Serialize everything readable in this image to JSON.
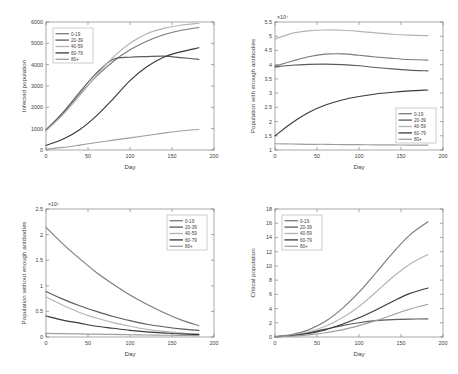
{
  "figure": {
    "background": "#ffffff",
    "series_colors": [
      "#7b7b7b",
      "#5c5c5c",
      "#b4b4b4",
      "#3a3a3a",
      "#9e9e9e"
    ],
    "axis_color": "#6e6e6e",
    "text_color": "#3d3d3d"
  },
  "legend_labels": [
    "0-19",
    "20-39",
    "40-59",
    "60-79",
    "80+"
  ],
  "chart_data": [
    {
      "id": "infected-population",
      "type": "line",
      "title": "",
      "xlabel": "Day",
      "ylabel": "Infected population",
      "xlim": [
        0,
        200
      ],
      "ylim": [
        0,
        6000
      ],
      "xticks": [
        0,
        50,
        100,
        150,
        200
      ],
      "yticks": [
        0,
        1000,
        2000,
        3000,
        4000,
        5000,
        6000
      ],
      "y_exponent": "",
      "grid": false,
      "legend_position": "top-left",
      "x": [
        0,
        20,
        40,
        60,
        80,
        100,
        120,
        140,
        160,
        182
      ],
      "series": [
        {
          "name": "0-19",
          "values": [
            950,
            1700,
            2600,
            3450,
            4150,
            4700,
            5100,
            5400,
            5600,
            5740
          ]
        },
        {
          "name": "20-39",
          "values": [
            930,
            1750,
            2700,
            3600,
            4250,
            4350,
            4380,
            4400,
            4330,
            4250
          ]
        },
        {
          "name": "40-59",
          "values": [
            900,
            1650,
            2550,
            3500,
            4350,
            5000,
            5450,
            5700,
            5850,
            5940
          ]
        },
        {
          "name": "60-79",
          "values": [
            220,
            500,
            950,
            1600,
            2400,
            3250,
            3900,
            4350,
            4600,
            4790
          ]
        },
        {
          "name": "80+",
          "values": [
            40,
            120,
            230,
            350,
            460,
            570,
            680,
            790,
            890,
            960
          ]
        }
      ]
    },
    {
      "id": "population-with-enough-antibodies",
      "type": "line",
      "title": "",
      "xlabel": "Day",
      "ylabel": "Population with enough antibodies",
      "xlim": [
        0,
        200
      ],
      "ylim": [
        1,
        5.5
      ],
      "xticks": [
        0,
        50,
        100,
        150,
        200
      ],
      "yticks": [
        1,
        1.5,
        2,
        2.5,
        3,
        3.5,
        4,
        4.5,
        5,
        5.5
      ],
      "y_exponent": "×10⁴",
      "grid": false,
      "legend_position": "bottom-right",
      "x": [
        0,
        20,
        40,
        60,
        80,
        100,
        120,
        140,
        160,
        182
      ],
      "series": [
        {
          "name": "0-19",
          "values": [
            3.95,
            4.12,
            4.28,
            4.37,
            4.38,
            4.33,
            4.27,
            4.22,
            4.18,
            4.16
          ]
        },
        {
          "name": "20-39",
          "values": [
            3.92,
            3.98,
            4.01,
            4.02,
            4.0,
            3.96,
            3.9,
            3.85,
            3.81,
            3.78
          ]
        },
        {
          "name": "40-59",
          "values": [
            4.9,
            5.1,
            5.19,
            5.22,
            5.21,
            5.17,
            5.12,
            5.07,
            5.04,
            5.02
          ]
        },
        {
          "name": "60-79",
          "values": [
            1.5,
            1.95,
            2.32,
            2.58,
            2.76,
            2.88,
            2.97,
            3.03,
            3.08,
            3.11
          ]
        },
        {
          "name": "80+",
          "values": [
            1.22,
            1.21,
            1.2,
            1.2,
            1.19,
            1.19,
            1.18,
            1.18,
            1.17,
            1.17
          ]
        }
      ]
    },
    {
      "id": "population-without-enough-antibodies",
      "type": "line",
      "title": "",
      "xlabel": "Day",
      "ylabel": "Population without enough antibodies",
      "xlim": [
        0,
        200
      ],
      "ylim": [
        0,
        2.5
      ],
      "xticks": [
        0,
        50,
        100,
        150,
        200
      ],
      "yticks": [
        0,
        0.5,
        1,
        1.5,
        2,
        2.5
      ],
      "y_exponent": "×10⁴",
      "grid": false,
      "legend_position": "top-right",
      "x": [
        0,
        20,
        40,
        60,
        80,
        100,
        120,
        140,
        160,
        182
      ],
      "series": [
        {
          "name": "0-19",
          "values": [
            2.14,
            1.82,
            1.53,
            1.26,
            1.03,
            0.82,
            0.64,
            0.48,
            0.34,
            0.22
          ]
        },
        {
          "name": "20-39",
          "values": [
            0.89,
            0.74,
            0.61,
            0.5,
            0.4,
            0.32,
            0.25,
            0.2,
            0.16,
            0.13
          ]
        },
        {
          "name": "40-59",
          "values": [
            0.78,
            0.62,
            0.48,
            0.37,
            0.28,
            0.21,
            0.15,
            0.11,
            0.08,
            0.05
          ]
        },
        {
          "name": "60-79",
          "values": [
            0.41,
            0.33,
            0.27,
            0.21,
            0.17,
            0.13,
            0.1,
            0.08,
            0.06,
            0.05
          ]
        },
        {
          "name": "80+",
          "values": [
            0.07,
            0.065,
            0.06,
            0.055,
            0.05,
            0.045,
            0.04,
            0.035,
            0.03,
            0.028
          ]
        }
      ]
    },
    {
      "id": "critical-population",
      "type": "line",
      "title": "",
      "xlabel": "Day",
      "ylabel": "Critical population",
      "xlim": [
        0,
        200
      ],
      "ylim": [
        0,
        18
      ],
      "xticks": [
        0,
        50,
        100,
        150,
        200
      ],
      "yticks": [
        0,
        2,
        4,
        6,
        8,
        10,
        12,
        14,
        16,
        18
      ],
      "y_exponent": "",
      "grid": false,
      "legend_position": "top-left",
      "x": [
        0,
        20,
        40,
        60,
        80,
        100,
        120,
        140,
        160,
        182
      ],
      "series": [
        {
          "name": "0-19",
          "values": [
            0.05,
            0.35,
            1.0,
            2.2,
            4.0,
            6.3,
            9.0,
            11.8,
            14.3,
            16.2
          ]
        },
        {
          "name": "20-39",
          "values": [
            0.05,
            0.25,
            0.6,
            1.1,
            1.6,
            2.0,
            2.3,
            2.45,
            2.52,
            2.55
          ]
        },
        {
          "name": "40-59",
          "values": [
            0.04,
            0.25,
            0.7,
            1.5,
            2.7,
            4.3,
            6.3,
            8.4,
            10.2,
            11.6
          ]
        },
        {
          "name": "60-79",
          "values": [
            0.03,
            0.18,
            0.5,
            1.0,
            1.8,
            2.7,
            3.8,
            5.0,
            6.1,
            6.9
          ]
        },
        {
          "name": "80+",
          "values": [
            0.02,
            0.1,
            0.3,
            0.6,
            1.0,
            1.6,
            2.3,
            3.1,
            3.9,
            4.6
          ]
        }
      ]
    }
  ]
}
